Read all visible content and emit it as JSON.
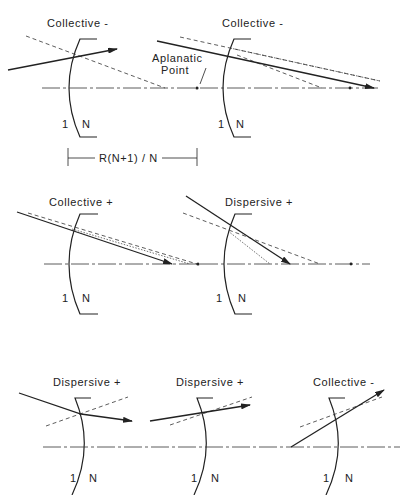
{
  "figure": {
    "panels": [
      {
        "id": "p1",
        "title": "Collective -",
        "media_left": "1",
        "media_right": "N"
      },
      {
        "id": "p2",
        "title": "Collective -",
        "media_left": "1",
        "media_right": "N"
      },
      {
        "id": "p3",
        "title": "Collective +",
        "media_left": "1",
        "media_right": "N"
      },
      {
        "id": "p4",
        "title": "Dispersive +",
        "media_left": "1",
        "media_right": "N"
      },
      {
        "id": "p5",
        "title": "Dispersive +",
        "media_left": "1",
        "media_right": "N"
      },
      {
        "id": "p6",
        "title": "Dispersive +",
        "media_left": "1",
        "media_right": "N"
      },
      {
        "id": "p7",
        "title": "Collective -",
        "media_left": "1",
        "media_right": "N"
      }
    ],
    "annotations": {
      "aplanatic_line1": "Aplanatic",
      "aplanatic_line2": "Point",
      "dimension": "R(N+1) / N"
    }
  }
}
